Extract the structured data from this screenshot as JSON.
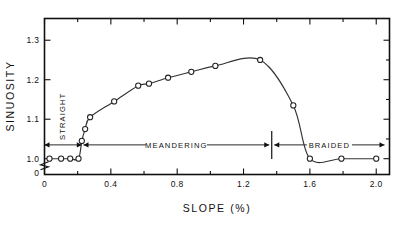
{
  "chart_data": {
    "type": "line",
    "title": "",
    "xlabel": "SLOPE (%)",
    "ylabel": "SINUOSITY",
    "xlim": [
      0,
      2.08
    ],
    "ylim": [
      0.96,
      1.355
    ],
    "grid": false,
    "legend": null,
    "x_ticks": [
      "0",
      "0.4",
      "0.8",
      "1.2",
      "1.6",
      "2.0"
    ],
    "x_tick_values": [
      0,
      0.4,
      0.8,
      1.2,
      1.6,
      2.0
    ],
    "x_minor_tick_values": [
      0.2,
      0.6,
      1.0,
      1.4,
      1.8
    ],
    "y_ticks": [
      "0",
      "1.0",
      "1.1",
      "1.2",
      "1.3"
    ],
    "y_tick_values": [
      0.965,
      1.0,
      1.1,
      1.2,
      1.3
    ],
    "axis_break": true,
    "axis_break_note": "y-axis broken between 0 and 1.0",
    "marker_style": "open-circle",
    "series": [
      {
        "name": "sinuosity",
        "x": [
          0.03,
          0.1,
          0.155,
          0.205,
          0.225,
          0.245,
          0.275,
          0.42,
          0.565,
          0.63,
          0.745,
          0.885,
          1.03,
          1.3,
          1.5,
          1.6,
          1.79,
          2.0
        ],
        "y": [
          1.0,
          1.0,
          1.0,
          1.0,
          1.045,
          1.075,
          1.105,
          1.145,
          1.185,
          1.19,
          1.205,
          1.22,
          1.235,
          1.25,
          1.135,
          1.0,
          1.0,
          1.0
        ]
      }
    ],
    "annotations": [
      {
        "name": "straight",
        "label": "STRAIGHT",
        "orientation": "vertical",
        "x_start": 0.0,
        "x_end": 0.225
      },
      {
        "name": "meandering",
        "label": "MEANDERING",
        "orientation": "horizontal",
        "x_start": 0.235,
        "x_end": 1.355
      },
      {
        "name": "braided",
        "label": "BRAIDED",
        "orientation": "horizontal",
        "x_start": 1.385,
        "x_end": 2.05
      },
      {
        "name": "divider",
        "label": "",
        "orientation": "vertical-rule",
        "x_start": 1.37,
        "x_end": 1.37
      }
    ],
    "annotation_y_value": 1.035
  },
  "axis": {
    "x_title": "SLOPE (%)",
    "y_title": "SINUOSITY"
  },
  "labels": {
    "straight": "STRAIGHT",
    "meandering": "MEANDERING",
    "braided": "BRAIDED"
  },
  "colors": {
    "background": "#ffffff",
    "axis": "#111111",
    "curve": "#333333",
    "marker_fill": "#ffffff",
    "marker_stroke": "#222222"
  }
}
